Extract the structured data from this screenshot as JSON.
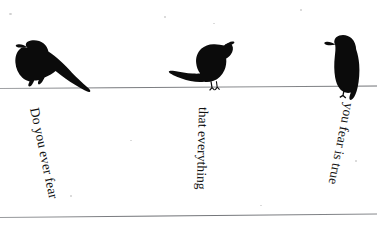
{
  "artwork": {
    "title": "Do you ever fear that everything you fear is true",
    "background_color": "#ffffff",
    "ink_color": "#121212",
    "wire_color": "#8d8f92"
  },
  "wires": [
    {
      "name": "upper-wire",
      "label": "upper wire"
    },
    {
      "name": "lower-wire",
      "label": "lower wire"
    }
  ],
  "birds": [
    {
      "label": "crow perched facing left with long tail",
      "facing": "left"
    },
    {
      "label": "crow perched facing right with long tail",
      "facing": "right"
    },
    {
      "label": "crow perched upright facing left",
      "facing": "left"
    }
  ],
  "phrases": [
    {
      "text": "Do you ever fear",
      "rotation": "78deg"
    },
    {
      "text": "that everything",
      "rotation": "91.5deg"
    },
    {
      "text": "you fear is true",
      "rotation": "101.5deg"
    }
  ]
}
